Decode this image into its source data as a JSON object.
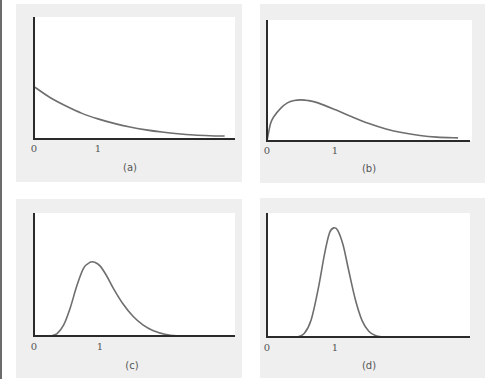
{
  "colors": {
    "panel_background": "#efefef",
    "plot_background": "#ffffff",
    "axis": "#2a2a2a",
    "curve": "#6e6e6e",
    "text": "#555555",
    "left_bar": "#6b6b6b"
  },
  "panels": [
    {
      "id": "a",
      "label": "(a)",
      "tick_0": "0",
      "tick_1": "1"
    },
    {
      "id": "b",
      "label": "(b)",
      "tick_0": "0",
      "tick_1": "1"
    },
    {
      "id": "c",
      "label": "(c)",
      "tick_0": "0",
      "tick_1": "1"
    },
    {
      "id": "d",
      "label": "(d)",
      "tick_0": "0",
      "tick_1": "1"
    }
  ],
  "chart_data": [
    {
      "type": "line",
      "title": "(a)",
      "xlabel": "",
      "ylabel": "",
      "description": "Exponentially decaying density starting at a positive value at x=0",
      "x_ticks": [
        "0",
        "1"
      ],
      "y_ticks": [],
      "xlim": [
        0,
        3.1
      ],
      "ylim": [
        0,
        1.0
      ],
      "grid": false,
      "legend": null,
      "x": [
        0,
        0.25,
        0.5,
        0.75,
        1.0,
        1.25,
        1.5,
        1.75,
        2.0,
        2.25,
        2.5,
        2.75,
        2.97
      ],
      "y": [
        0.43,
        0.34,
        0.27,
        0.21,
        0.165,
        0.128,
        0.098,
        0.075,
        0.057,
        0.043,
        0.033,
        0.027,
        0.024
      ]
    },
    {
      "type": "line",
      "title": "(b)",
      "xlabel": "",
      "ylabel": "",
      "description": "Right-skewed density starting at 0, peak near x=0.5",
      "x_ticks": [
        "0",
        "1"
      ],
      "y_ticks": [],
      "xlim": [
        0,
        3.0
      ],
      "ylim": [
        0,
        1.0
      ],
      "grid": false,
      "legend": null,
      "x": [
        0,
        0.05,
        0.1,
        0.2,
        0.3,
        0.4,
        0.5,
        0.6,
        0.75,
        1.0,
        1.25,
        1.5,
        1.75,
        2.0,
        2.25,
        2.5,
        2.8
      ],
      "y": [
        0,
        0.14,
        0.2,
        0.27,
        0.315,
        0.335,
        0.34,
        0.335,
        0.315,
        0.26,
        0.2,
        0.145,
        0.1,
        0.068,
        0.045,
        0.032,
        0.026
      ]
    },
    {
      "type": "line",
      "title": "(c)",
      "xlabel": "",
      "ylabel": "",
      "description": "Moderately right-skewed unimodal density, peak near x=0.9",
      "x_ticks": [
        "0",
        "1"
      ],
      "y_ticks": [],
      "xlim": [
        0,
        3.1
      ],
      "ylim": [
        0,
        1.0
      ],
      "grid": false,
      "legend": null,
      "x": [
        0.25,
        0.35,
        0.45,
        0.55,
        0.65,
        0.75,
        0.85,
        0.92,
        1.0,
        1.1,
        1.2,
        1.35,
        1.5,
        1.65,
        1.8,
        2.0,
        2.2
      ],
      "y": [
        0,
        0.02,
        0.09,
        0.23,
        0.41,
        0.55,
        0.6,
        0.6,
        0.57,
        0.49,
        0.39,
        0.26,
        0.16,
        0.09,
        0.045,
        0.012,
        0
      ]
    },
    {
      "type": "line",
      "title": "(d)",
      "xlabel": "",
      "ylabel": "",
      "description": "Nearly symmetric, tall narrow density centered near x=1",
      "x_ticks": [
        "0",
        "1"
      ],
      "y_ticks": [],
      "xlim": [
        0,
        3.0
      ],
      "ylim": [
        0,
        1.0
      ],
      "grid": false,
      "legend": null,
      "x": [
        0.45,
        0.55,
        0.65,
        0.75,
        0.85,
        0.92,
        0.98,
        1.04,
        1.12,
        1.2,
        1.3,
        1.4,
        1.5,
        1.6,
        1.7
      ],
      "y": [
        0,
        0.03,
        0.14,
        0.38,
        0.68,
        0.84,
        0.88,
        0.86,
        0.74,
        0.54,
        0.3,
        0.13,
        0.045,
        0.01,
        0
      ]
    }
  ]
}
